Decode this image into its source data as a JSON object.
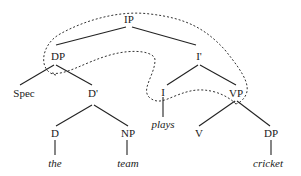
{
  "diagram": {
    "type": "syntax-tree",
    "nodes": {
      "ip": "IP",
      "dp_subject": "DP",
      "i_bar": "I'",
      "spec": "Spec",
      "d_bar": "D'",
      "i": "I",
      "vp": "VP",
      "d": "D",
      "np": "NP",
      "v": "V",
      "dp_object": "DP"
    },
    "words": {
      "the": "the",
      "team": "team",
      "plays": "plays",
      "cricket": "cricket"
    },
    "movement_arrows": [
      {
        "from": "I",
        "to": "DP",
        "style": "dashed"
      },
      {
        "from": "VP",
        "to": "DP",
        "style": "dashed"
      }
    ]
  }
}
